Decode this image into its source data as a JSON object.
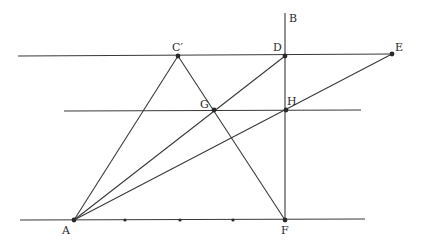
{
  "diagram": {
    "type": "geometric-construction",
    "points": {
      "A": {
        "label": "A",
        "x": 74,
        "y": 220
      },
      "B": {
        "label": "B",
        "x": 285,
        "y": 14
      },
      "C": {
        "label": "C′",
        "x": 178,
        "y": 56
      },
      "D": {
        "label": "D",
        "x": 285,
        "y": 56
      },
      "E": {
        "label": "E",
        "x": 392,
        "y": 54
      },
      "F": {
        "label": "F",
        "x": 285,
        "y": 220
      },
      "G": {
        "label": "G",
        "x": 214,
        "y": 110
      },
      "H": {
        "label": "H",
        "x": 286,
        "y": 110
      }
    },
    "tick_points": [
      {
        "x": 125,
        "y": 220
      },
      {
        "x": 180,
        "y": 220
      },
      {
        "x": 233,
        "y": 220
      }
    ],
    "lines": {
      "top_parallel": {
        "x1": 18,
        "y1": 56,
        "x2": 392,
        "y2": 54
      },
      "middle_parallel": {
        "x1": 64,
        "y1": 111,
        "x2": 361,
        "y2": 110
      },
      "bottom_line": {
        "x1": 20,
        "y1": 220,
        "x2": 365,
        "y2": 219
      },
      "vertical_BF": {
        "x1": 285,
        "y1": 13,
        "x2": 285,
        "y2": 220
      },
      "AC": {
        "x1": 74,
        "y1": 220,
        "x2": 178,
        "y2": 56
      },
      "CF": {
        "x1": 178,
        "y1": 56,
        "x2": 285,
        "y2": 220
      },
      "AD": {
        "x1": 74,
        "y1": 220,
        "x2": 285,
        "y2": 56
      },
      "AE": {
        "x1": 74,
        "y1": 220,
        "x2": 392,
        "y2": 54
      }
    }
  }
}
